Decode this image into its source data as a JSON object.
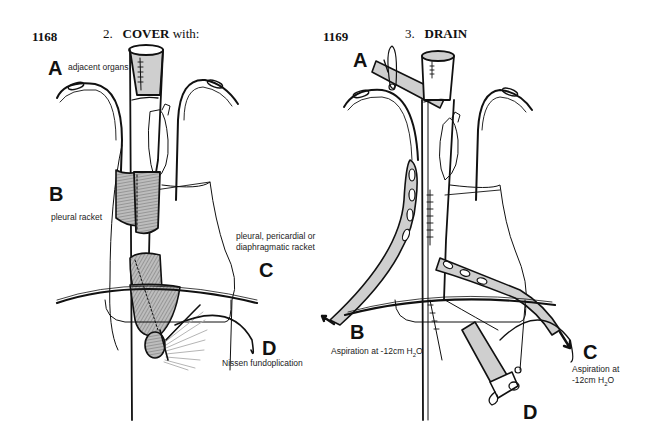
{
  "figures": [
    {
      "number": "1168",
      "step_number": "2.",
      "step_title": "COVER",
      "step_suffix": "with:",
      "labels": [
        {
          "letter": "A",
          "caption": "adjacent organs"
        },
        {
          "letter": "B",
          "caption": "pleural racket"
        },
        {
          "letter": "C",
          "caption_lines": [
            "pleural, pericardial or",
            "diaphragmatic racket"
          ]
        },
        {
          "letter": "D",
          "caption": "Nissen fundoplication"
        }
      ]
    },
    {
      "number": "1169",
      "step_number": "3.",
      "step_title": "DRAIN",
      "labels": [
        {
          "letter": "A"
        },
        {
          "letter": "B",
          "caption_pre": "Aspiration at -12cm H",
          "caption_sub": "2",
          "caption_post": "O"
        },
        {
          "letter": "C",
          "caption_line1": "Aspiration at",
          "caption_pre": "-12cm H",
          "caption_sub": "2",
          "caption_post": "O"
        },
        {
          "letter": "D"
        }
      ]
    }
  ],
  "colors": {
    "ink": "#111111",
    "shade": "#cfcfcf",
    "hatch": "#9a9a9a"
  }
}
